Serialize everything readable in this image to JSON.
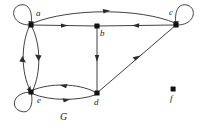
{
  "figure": {
    "caption": "G",
    "caption_position": {
      "x": 60,
      "y": 112
    },
    "background": "#ffffff",
    "stroke_color": "#2b2b2b",
    "vertex_color": "#111111",
    "width": 204,
    "height": 131
  },
  "graph": {
    "type": "directed",
    "vertices": [
      {
        "id": "a",
        "label": "a",
        "x": 31,
        "y": 25,
        "label_x": 36,
        "label_y": 12,
        "isolated": false
      },
      {
        "id": "b",
        "label": "b",
        "x": 97,
        "y": 26,
        "label_x": 100,
        "label_y": 30,
        "isolated": false
      },
      {
        "id": "c",
        "label": "c",
        "x": 176,
        "y": 25,
        "label_x": 170,
        "label_y": 11,
        "isolated": false
      },
      {
        "id": "d",
        "label": "d",
        "x": 97,
        "y": 93,
        "label_x": 95,
        "label_y": 99,
        "isolated": false
      },
      {
        "id": "e",
        "label": "e",
        "x": 31,
        "y": 92,
        "label_x": 36,
        "label_y": 97,
        "isolated": false
      },
      {
        "id": "f",
        "label": "f",
        "x": 173,
        "y": 89,
        "label_x": 170,
        "label_y": 95,
        "isolated": true
      }
    ],
    "edges": [
      {
        "from": "a",
        "to": "a",
        "kind": "self-loop",
        "label": "a-self-loop"
      },
      {
        "from": "c",
        "to": "c",
        "kind": "self-loop",
        "label": "c-self-loop"
      },
      {
        "from": "e",
        "to": "e",
        "kind": "self-loop",
        "label": "e-self-loop"
      },
      {
        "from": "a",
        "to": "c",
        "kind": "curved",
        "label": "a-to-c"
      },
      {
        "from": "a",
        "to": "b",
        "kind": "straight",
        "label": "a-to-b"
      },
      {
        "from": "c",
        "to": "b",
        "kind": "straight",
        "label": "c-to-b"
      },
      {
        "from": "a",
        "to": "e",
        "kind": "curved",
        "label": "a-to-e"
      },
      {
        "from": "e",
        "to": "a",
        "kind": "curved",
        "label": "e-to-a"
      },
      {
        "from": "b",
        "to": "d",
        "kind": "straight",
        "label": "b-to-d"
      },
      {
        "from": "d",
        "to": "c",
        "kind": "straight",
        "label": "d-to-c"
      },
      {
        "from": "d",
        "to": "e",
        "kind": "curved",
        "label": "d-to-e"
      },
      {
        "from": "e",
        "to": "d",
        "kind": "curved",
        "label": "e-to-d"
      }
    ]
  }
}
